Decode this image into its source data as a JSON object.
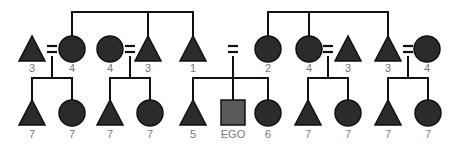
{
  "colors": {
    "symbol_fill": "#2b2b2b",
    "ego_fill": "#5a5a5a",
    "line": "#111111",
    "label": "#777777"
  },
  "legend_semantics": {
    "triangle": "person (sex unspecified/male)",
    "circle": "female",
    "square": "ego",
    "equals": "marriage"
  },
  "top_row": [
    {
      "shape": "triangle",
      "label": "3"
    },
    {
      "shape": "circle",
      "label": "4"
    },
    {
      "shape": "circle",
      "label": "4"
    },
    {
      "shape": "triangle",
      "label": "3"
    },
    {
      "shape": "triangle",
      "label": "1"
    },
    {
      "shape": "circle",
      "label": "2"
    },
    {
      "shape": "circle",
      "label": "4"
    },
    {
      "shape": "triangle",
      "label": "3"
    },
    {
      "shape": "triangle",
      "label": "3"
    },
    {
      "shape": "circle",
      "label": "4"
    }
  ],
  "bottom_row": [
    {
      "shape": "triangle",
      "label": "7"
    },
    {
      "shape": "circle",
      "label": "7"
    },
    {
      "shape": "triangle",
      "label": "7"
    },
    {
      "shape": "circle",
      "label": "7"
    },
    {
      "shape": "triangle",
      "label": "5"
    },
    {
      "shape": "square",
      "label": "EGO"
    },
    {
      "shape": "circle",
      "label": "6"
    },
    {
      "shape": "triangle",
      "label": "7"
    },
    {
      "shape": "circle",
      "label": "7"
    },
    {
      "shape": "triangle",
      "label": "7"
    },
    {
      "shape": "circle",
      "label": "7"
    }
  ]
}
